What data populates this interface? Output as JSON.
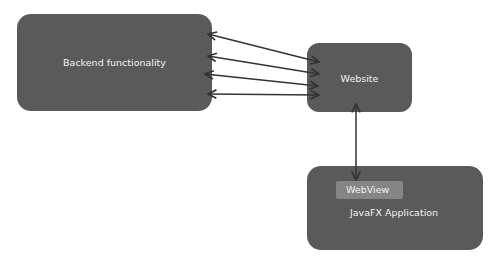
{
  "diagram": {
    "nodes": {
      "backend": {
        "label": "Backend functionality"
      },
      "website": {
        "label": "Website"
      },
      "javafx": {
        "label": "JavaFX Application"
      },
      "webview": {
        "label": "WebView"
      }
    },
    "edges": [
      {
        "from": "Backend functionality",
        "to": "Website",
        "direction": "bidirectional"
      },
      {
        "from": "Backend functionality",
        "to": "Website",
        "direction": "bidirectional"
      },
      {
        "from": "Backend functionality",
        "to": "Website",
        "direction": "bidirectional"
      },
      {
        "from": "Backend functionality",
        "to": "Website",
        "direction": "bidirectional"
      },
      {
        "from": "Website",
        "to": "WebView",
        "direction": "bidirectional"
      }
    ],
    "colors": {
      "node_fill": "#5a5a5a",
      "webview_fill": "#858585",
      "text": "#f2f2f2",
      "arrow": "#333333"
    }
  }
}
